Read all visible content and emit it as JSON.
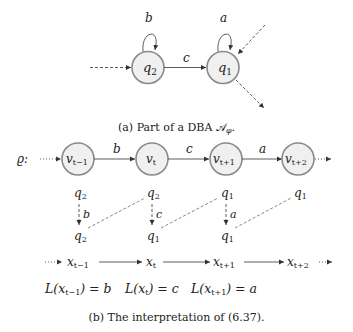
{
  "colors": {
    "node_fill": "#f0f0f0",
    "node_stroke": "#8a8a8a",
    "line": "#333333",
    "text": "#222222"
  },
  "figure_a": {
    "caption": "(a) Part of a DBA 𝒜",
    "caption_sub": "φ",
    "caption_end": ".",
    "states": [
      {
        "id": "q2",
        "label": "q",
        "sub": "2",
        "self_loop_label": "b"
      },
      {
        "id": "q1",
        "label": "q",
        "sub": "1",
        "self_loop_label": "a"
      }
    ],
    "edges": [
      {
        "from": "q2",
        "to": "q1",
        "label": "c"
      }
    ]
  },
  "figure_b": {
    "caption": "(b) The interpretation of (6.37).",
    "run_label": "ϱ:",
    "run_nodes": [
      {
        "label": "v",
        "sub": "t−1"
      },
      {
        "label": "v",
        "sub": "t"
      },
      {
        "label": "v",
        "sub": "t+1"
      },
      {
        "label": "v",
        "sub": "t+2"
      }
    ],
    "run_edge_labels": [
      "b",
      "c",
      "a"
    ],
    "upper_states": [
      {
        "label": "q",
        "sub": "2"
      },
      {
        "label": "q",
        "sub": "2"
      },
      {
        "label": "q",
        "sub": "1"
      },
      {
        "label": "q",
        "sub": "1"
      }
    ],
    "transition_labels": [
      "b",
      "c",
      "a"
    ],
    "lower_states": [
      {
        "label": "q",
        "sub": "2"
      },
      {
        "label": "q",
        "sub": "1"
      },
      {
        "label": "q",
        "sub": "1"
      }
    ],
    "x_nodes": [
      {
        "label": "x",
        "sub": "t−1"
      },
      {
        "label": "x",
        "sub": "t"
      },
      {
        "label": "x",
        "sub": "t+1"
      },
      {
        "label": "x",
        "sub": "t+2"
      }
    ],
    "labelings": [
      {
        "lhs": "L(x",
        "sub": "t−1",
        "rhs": ") = b"
      },
      {
        "lhs": "L(x",
        "sub": "t",
        "rhs": ") = c"
      },
      {
        "lhs": "L(x",
        "sub": "t+1",
        "rhs": ") = a"
      }
    ]
  }
}
